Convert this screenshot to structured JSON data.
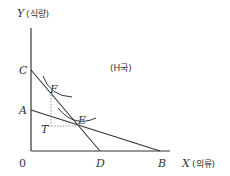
{
  "diagram": {
    "country_label": "(H국)",
    "axes": {
      "y_label_var": "Y",
      "y_label_kor": "(식량)",
      "x_label_var": "X",
      "x_label_kor": "(의류)",
      "origin": "0"
    },
    "points": {
      "C": "C",
      "A": "A",
      "F": "F",
      "E": "E",
      "T": "T",
      "D": "D",
      "B": "B"
    },
    "colors": {
      "line": "#333333",
      "dashed": "#777777",
      "background": "#ffffff"
    }
  }
}
